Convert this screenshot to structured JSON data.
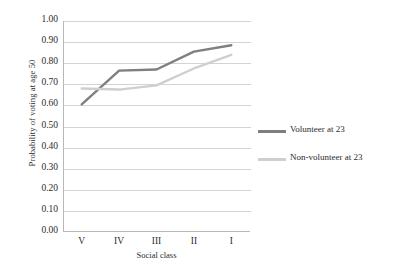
{
  "chart_data": {
    "type": "line",
    "title": "",
    "xlabel": "Social class",
    "ylabel": "Probability of voting at age 50",
    "categories": [
      "V",
      "IV",
      "III",
      "II",
      "I"
    ],
    "ylim": [
      0.0,
      1.0
    ],
    "ytick_labels": [
      "1.00",
      "0.90",
      "0.80",
      "0.70",
      "0.60",
      "0.50",
      "0.40",
      "0.30",
      "0.20",
      "0.10",
      "0.00"
    ],
    "ytick_values": [
      1.0,
      0.9,
      0.8,
      0.7,
      0.6,
      0.5,
      0.4,
      0.3,
      0.2,
      0.1,
      0.0
    ],
    "grid": true,
    "legend_position": "right",
    "series": [
      {
        "name": "Volunteer at 23",
        "color": "#7f7f7f",
        "values": [
          0.605,
          0.765,
          0.77,
          0.855,
          0.885
        ]
      },
      {
        "name": "Non-volunteer at 23",
        "color": "#cfcfcf",
        "values": [
          0.68,
          0.675,
          0.695,
          0.775,
          0.84
        ]
      }
    ]
  },
  "legend": {
    "entries": [
      {
        "label": "Volunteer at 23"
      },
      {
        "label": "Non-volunteer at 23"
      }
    ]
  },
  "colors": {
    "volunteer": "#7f7f7f",
    "nonvolunteer": "#cfcfcf",
    "gridline": "#d4d4d4",
    "axis": "#b8b8b8",
    "text": "#2b2b2b"
  }
}
